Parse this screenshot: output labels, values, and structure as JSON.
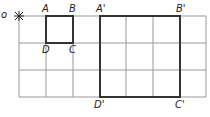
{
  "diagram": {
    "grid": {
      "x": [
        19,
        46,
        73,
        100,
        126,
        153,
        180,
        206
      ],
      "y": [
        16,
        43,
        70,
        97
      ],
      "color": "#888888"
    },
    "center_marker": {
      "symbol": "✳",
      "x": 19,
      "y": 16
    },
    "small_square": {
      "labels": {
        "A": "A",
        "B": "B",
        "C": "C",
        "D": "D"
      }
    },
    "large_square": {
      "labels": {
        "A": "A'",
        "B": "B'",
        "C": "C'",
        "D": "D'"
      }
    },
    "edge_label": "o",
    "stroke_color": "#333333"
  }
}
